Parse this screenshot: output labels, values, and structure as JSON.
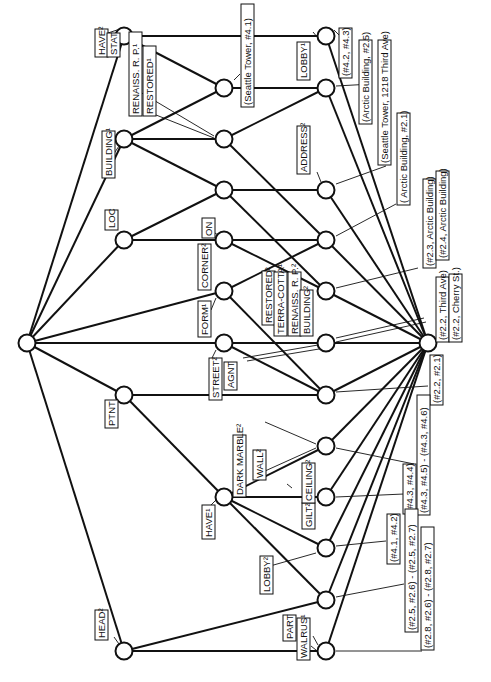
{
  "diagram": {
    "type": "concept-lattice",
    "orientation": "rotated-90-ccw",
    "colors": {
      "line": "#111111",
      "background": "#ffffff",
      "node_fill": "#ffffff"
    },
    "nodes": [
      {
        "id": "top",
        "x": 27,
        "y": 343
      },
      {
        "id": "n_have2",
        "x": 124,
        "y": 36
      },
      {
        "id": "n_building1",
        "x": 124,
        "y": 139
      },
      {
        "id": "n_loc",
        "x": 124,
        "y": 240
      },
      {
        "id": "n_ptnt",
        "x": 124,
        "y": 395
      },
      {
        "id": "n_head2",
        "x": 124,
        "y": 651
      },
      {
        "id": "n_seattle41",
        "x": 224,
        "y": 88
      },
      {
        "id": "n_renaiss",
        "x": 224,
        "y": 139
      },
      {
        "id": "n_mid190",
        "x": 224,
        "y": 190
      },
      {
        "id": "n_on",
        "x": 224,
        "y": 240
      },
      {
        "id": "n_corner",
        "x": 224,
        "y": 291
      },
      {
        "id": "n_form",
        "x": 224,
        "y": 343
      },
      {
        "id": "n_have1",
        "x": 224,
        "y": 497
      },
      {
        "id": "n_lobby1",
        "x": 326,
        "y": 36
      },
      {
        "id": "n_arctic25",
        "x": 326,
        "y": 88
      },
      {
        "id": "n_address",
        "x": 326,
        "y": 190
      },
      {
        "id": "n_arctic21",
        "x": 326,
        "y": 240
      },
      {
        "id": "n_terracotta",
        "x": 326,
        "y": 291
      },
      {
        "id": "n_street",
        "x": 326,
        "y": 343
      },
      {
        "id": "n_agnt",
        "x": 326,
        "y": 395
      },
      {
        "id": "n_wall",
        "x": 326,
        "y": 446
      },
      {
        "id": "n_ceiling",
        "x": 326,
        "y": 497
      },
      {
        "id": "n_lobby2",
        "x": 326,
        "y": 548
      },
      {
        "id": "n_p2526",
        "x": 326,
        "y": 600
      },
      {
        "id": "n_walrus",
        "x": 326,
        "y": 651
      },
      {
        "id": "bottom",
        "x": 428,
        "y": 343
      }
    ],
    "edges": [
      [
        "top",
        "n_have2"
      ],
      [
        "top",
        "n_building1"
      ],
      [
        "top",
        "n_loc"
      ],
      [
        "top",
        "n_corner"
      ],
      [
        "top",
        "n_form"
      ],
      [
        "top",
        "n_ptnt"
      ],
      [
        "top",
        "n_head2"
      ],
      [
        "n_have2",
        "n_seattle41"
      ],
      [
        "n_have2",
        "n_lobby1"
      ],
      [
        "n_building1",
        "n_seattle41"
      ],
      [
        "n_building1",
        "n_renaiss"
      ],
      [
        "n_building1",
        "n_mid190"
      ],
      [
        "n_loc",
        "n_mid190"
      ],
      [
        "n_loc",
        "n_on"
      ],
      [
        "n_seattle41",
        "n_arctic25"
      ],
      [
        "n_renaiss",
        "n_arctic25"
      ],
      [
        "n_renaiss",
        "n_arctic21"
      ],
      [
        "n_mid190",
        "n_address"
      ],
      [
        "n_mid190",
        "n_terracotta"
      ],
      [
        "n_on",
        "n_arctic21"
      ],
      [
        "n_on",
        "n_terracotta"
      ],
      [
        "n_corner",
        "n_arctic21"
      ],
      [
        "n_corner",
        "n_agnt"
      ],
      [
        "n_form",
        "n_street"
      ],
      [
        "n_form",
        "n_agnt"
      ],
      [
        "n_ptnt",
        "n_agnt"
      ],
      [
        "n_ptnt",
        "n_have1"
      ],
      [
        "n_have1",
        "n_wall"
      ],
      [
        "n_have1",
        "n_ceiling"
      ],
      [
        "n_have1",
        "n_lobby2"
      ],
      [
        "n_have1",
        "n_p2526"
      ],
      [
        "n_head2",
        "n_p2526"
      ],
      [
        "n_head2",
        "n_walrus"
      ],
      [
        "n_lobby1",
        "bottom"
      ],
      [
        "n_arctic25",
        "bottom"
      ],
      [
        "n_address",
        "bottom"
      ],
      [
        "n_arctic21",
        "bottom"
      ],
      [
        "n_terracotta",
        "bottom"
      ],
      [
        "n_street",
        "bottom"
      ],
      [
        "n_agnt",
        "bottom"
      ],
      [
        "n_wall",
        "bottom"
      ],
      [
        "n_ceiling",
        "bottom"
      ],
      [
        "n_lobby2",
        "bottom"
      ],
      [
        "n_p2526",
        "bottom"
      ],
      [
        "n_walrus",
        "bottom"
      ]
    ],
    "concept_labels": {
      "have2": "HAVE²",
      "stat": "STAT",
      "building1": "BUILDING¹",
      "loc": "LOC",
      "ptnt": "PTNT",
      "head2": "HEAD²",
      "renaiss1": "RENAISS. R. P.¹",
      "restored1": "RESTORED¹",
      "on": "ON",
      "corner2": "CORNER²",
      "form1": "FORM¹",
      "street2": "STREET²",
      "agnt": "AGNT",
      "have1": "HAVE¹",
      "lobby1": "LOBBY¹",
      "address2": "ADDRESS²",
      "restored2": "RESTORED²",
      "terracotta1": "TERRA-COTTA¹",
      "renaiss2": "RENAISS. R. P.²",
      "building2": "BUILDING²",
      "dark_marble2": "DARK MARBLE²",
      "wall2": "WALL²",
      "gilt2": "GILT²",
      "ceiling2": "CEILING²",
      "lobby2": "LOBBY²",
      "part": "PART",
      "walrus1": "WALRUS¹"
    },
    "object_labels": {
      "seattle41": "(Seattle Tower, #4.1)",
      "o4243": "(#4.2, #4.3)",
      "arctic25": "(Arctic Building, #2.5)",
      "seattle1218": "(Seattle Tower, 1218 Third Ave)",
      "arctic21": "( Arctic Building, #2.1)",
      "p23arctic": "(#2.3, Arctic Building)",
      "p24arctic": "(#2.4, Arctic Building)",
      "p22third": "(#2.2, Third Ave)",
      "p22cherry": "(#2.2, Cherry St.)",
      "p2221": "(#2.2, #2.1)",
      "p4345": "(#4.3, #4.5) - (#4.3, #4.6)",
      "p4344": "(#4.3, #4.4)",
      "p4142": "(#4.1, #4.2)",
      "p2526": "(#2.5, #2.6) - (#2.5, #2.7)",
      "p2826": "(#2.8, #2.6) - (#2.8, #2.7)"
    }
  }
}
